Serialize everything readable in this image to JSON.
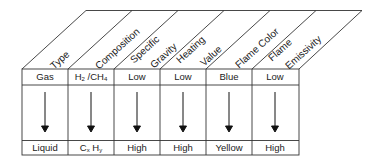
{
  "diagram": {
    "columns": [
      {
        "header": "Type",
        "header_lines": [
          "Type"
        ],
        "top_value": "Gas",
        "bottom_value": "Liquid"
      },
      {
        "header": "Composition",
        "header_lines": [
          "Composition"
        ],
        "top_value": "H2 /CH4",
        "bottom_value": "Cx Hy"
      },
      {
        "header": "Specific Gravity",
        "header_lines": [
          "Specific",
          "Gravity"
        ],
        "top_value": "Low",
        "bottom_value": "High"
      },
      {
        "header": "Heating Value",
        "header_lines": [
          "Heating",
          "Value"
        ],
        "top_value": "Low",
        "bottom_value": "High"
      },
      {
        "header": "Flame Color",
        "header_lines": [
          "Flame Color"
        ],
        "top_value": "Blue",
        "bottom_value": "Yellow"
      },
      {
        "header": "Flame Emissivity",
        "header_lines": [
          "Flame",
          "Emissivity"
        ],
        "top_value": "Low",
        "bottom_value": "High"
      }
    ],
    "arrow_direction": "down",
    "colors": {
      "line": "#333333",
      "text": "#222222",
      "background": "#ffffff"
    }
  }
}
